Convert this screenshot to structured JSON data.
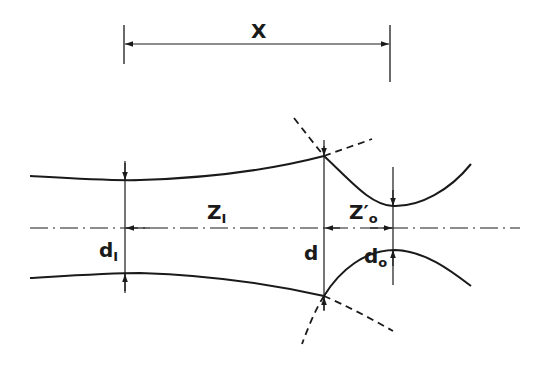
{
  "diagram": {
    "type": "gaussian-beam-focusing",
    "labels": {
      "X": "X",
      "Z_I": "Z",
      "Z_I_sub": "I",
      "Z_o_prime": "Z′",
      "Z_o_sub": "o",
      "d_I": "d",
      "d_I_sub": "I",
      "d": "d",
      "d_o": "d",
      "d_o_sub": "o"
    },
    "colors": {
      "line": "#1a1a1a",
      "background": "#ffffff"
    }
  }
}
